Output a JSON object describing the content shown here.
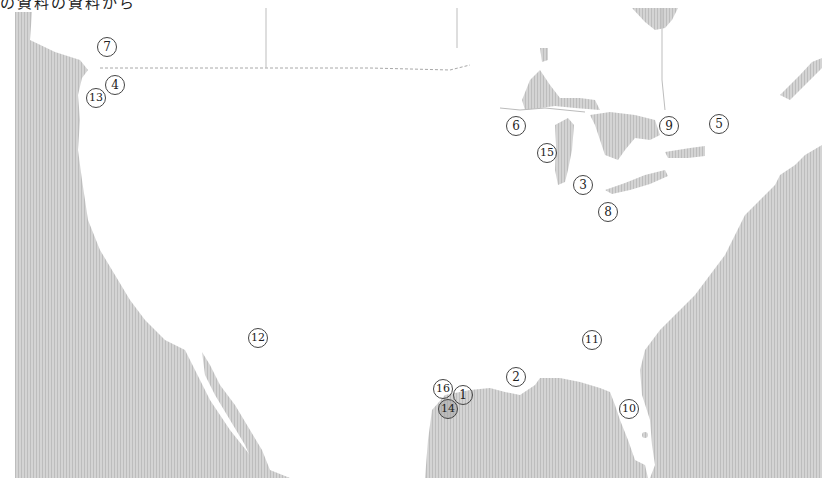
{
  "caption": "の資料の資料から",
  "map": {
    "region": "United States and surrounding coasts",
    "ocean_color": "#cfcfcf",
    "land_color": "#ffffff",
    "border_color": "#9a9a9a"
  },
  "markers": [
    {
      "label": "1",
      "x": 463,
      "y": 395
    },
    {
      "label": "2",
      "x": 516,
      "y": 377
    },
    {
      "label": "3",
      "x": 583,
      "y": 185
    },
    {
      "label": "4",
      "x": 115,
      "y": 85
    },
    {
      "label": "5",
      "x": 719,
      "y": 124
    },
    {
      "label": "6",
      "x": 516,
      "y": 126
    },
    {
      "label": "7",
      "x": 107,
      "y": 47
    },
    {
      "label": "8",
      "x": 608,
      "y": 212
    },
    {
      "label": "9",
      "x": 669,
      "y": 126
    },
    {
      "label": "10",
      "x": 629,
      "y": 409
    },
    {
      "label": "11",
      "x": 592,
      "y": 340
    },
    {
      "label": "12",
      "x": 258,
      "y": 338
    },
    {
      "label": "13",
      "x": 96,
      "y": 98
    },
    {
      "label": "14",
      "x": 448,
      "y": 409
    },
    {
      "label": "15",
      "x": 547,
      "y": 153
    },
    {
      "label": "16",
      "x": 443,
      "y": 389
    }
  ]
}
